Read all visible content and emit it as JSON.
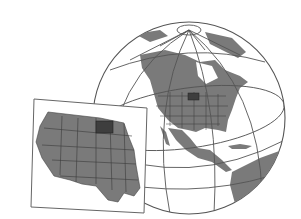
{
  "image": {
    "description": "Illustration of a globe centered on North America with a flat inset map of the western United States; North Dakota highlighted darker in both views",
    "colors": {
      "background": "#ffffff",
      "land": "#7a7a7a",
      "highlight": "#3e3e3e",
      "outline": "#4a4a4a",
      "grid": "#555555",
      "inset_frame": "#666666"
    }
  }
}
